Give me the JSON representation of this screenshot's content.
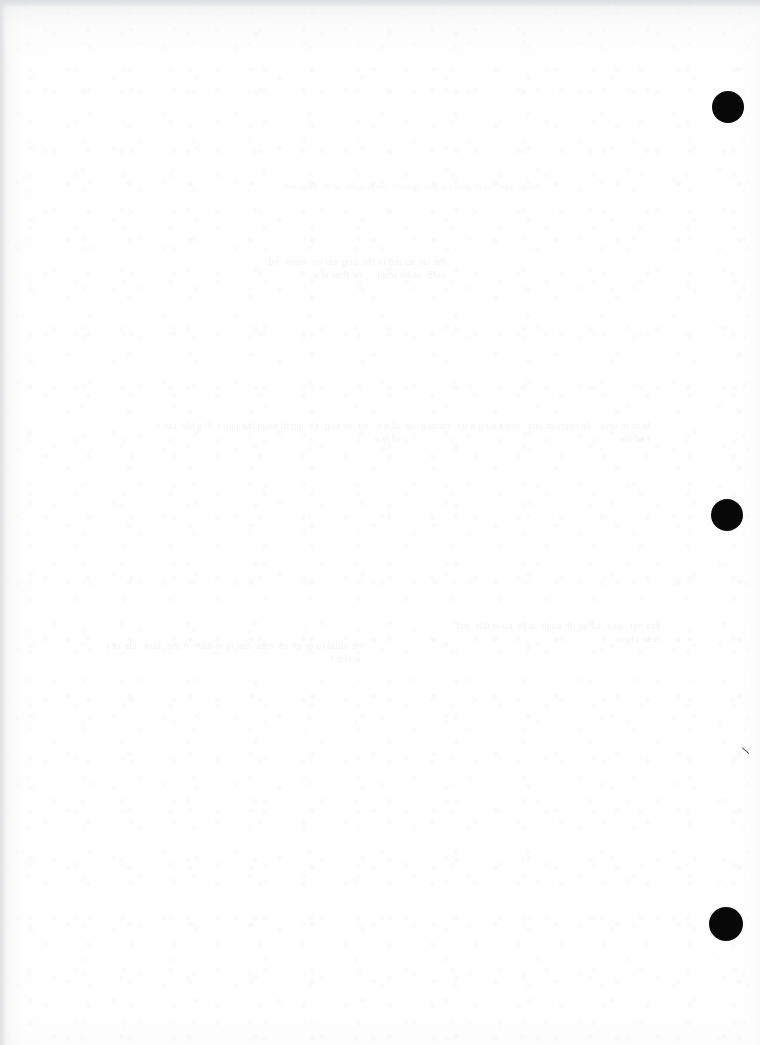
{
  "page": {
    "width": 760,
    "height": 1045,
    "background_color": "#fefefe",
    "paper_tone": "#fdfdfd"
  },
  "punch_holes": [
    {
      "name": "punch-hole-top",
      "cx": 728,
      "cy": 107,
      "diameter": 32,
      "color": "#080808"
    },
    {
      "name": "punch-hole-middle",
      "cx": 727,
      "cy": 515,
      "diameter": 32,
      "color": "#080808"
    },
    {
      "name": "punch-hole-bottom",
      "cx": 726,
      "cy": 924,
      "diameter": 34,
      "color": "#080808"
    }
  ],
  "marks": {
    "stray_tick": {
      "name": "stray-pen-tick",
      "x": 745,
      "y": 750,
      "color": "#56585e"
    }
  },
  "ghost_text": {
    "note": "Extremely faint bleed-through from the reverse side of the sheet; illegible at scan resolution.",
    "block_1": "the ter as ied in the orig nal co  ment  nd  ould  ot be read     ne ther si e",
    "block_2": "of a e   en  wr ting  sh  ing th ough the pap r  ill g ble  rac s of ty e",
    "block_3": "fa nt re erse   de impress ons   rema ning a ter  canni g  un ead ble",
    "block_4": "re idual to er gh st  ines  bar ly vi ible   n the  lank  ide of t e she t",
    "block_5": "sca ner  oise  nd se -th ough  arks  no le ible  ext  rese t her",
    "block_6": "blank  age  no pr nted co tent  pres nt  on th s sid  of th  docu ent"
  }
}
